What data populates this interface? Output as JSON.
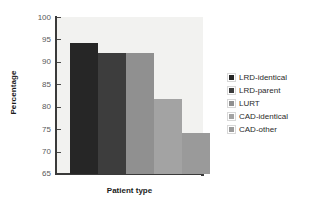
{
  "chart_data": {
    "type": "bar",
    "title": "",
    "xlabel": "Patient type",
    "ylabel": "Percentage",
    "ylim": [
      65,
      100
    ],
    "yticks": [
      100,
      95,
      90,
      85,
      80,
      75,
      70,
      65
    ],
    "grid": false,
    "legend_position": "right",
    "categories": [
      "LRD-identical",
      "LRD-parent",
      "LURT",
      "CAD-identical",
      "CAD-other"
    ],
    "values": [
      94.2,
      92.0,
      92.0,
      81.8,
      74.2
    ],
    "colors": [
      "#262626",
      "#3d3d3d",
      "#909090",
      "#a3a3a3",
      "#9a9a9a"
    ],
    "plot_background": "#f2f2f0"
  },
  "legend": {
    "items": [
      {
        "label": "LRD-identical",
        "color": "#262626"
      },
      {
        "label": "LRD-parent",
        "color": "#3d3d3d"
      },
      {
        "label": "LURT",
        "color": "#909090"
      },
      {
        "label": "CAD-identical",
        "color": "#a3a3a3"
      },
      {
        "label": "CAD-other",
        "color": "#9a9a9a"
      }
    ]
  }
}
